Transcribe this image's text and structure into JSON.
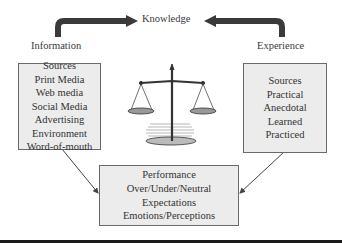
{
  "diagram": {
    "top_label": "Knowledge",
    "left_label": "Information",
    "right_label": "Experience",
    "information_box": {
      "lines": [
        "Sources",
        "Print Media",
        "Web media",
        "Social Media",
        "Advertising",
        "Environment",
        "Word-of-mouth"
      ]
    },
    "experience_box": {
      "lines": [
        "Sources",
        "Practical",
        "Anecdotal",
        "Learned",
        "Practiced"
      ]
    },
    "outcome_box": {
      "lines": [
        "Performance",
        "Over/Under/Neutral",
        "Expectations",
        "Emotions/Perceptions"
      ]
    },
    "center_icon": "balance-scale-icon",
    "colors": {
      "arrow": "#3a3a3a",
      "box_fill": "#ececec",
      "box_border": "#6a6a6a",
      "text": "#333333"
    }
  }
}
